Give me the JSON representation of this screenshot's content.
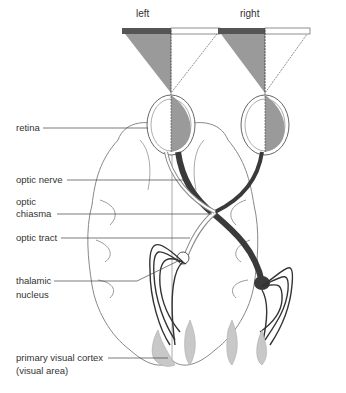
{
  "fields": {
    "left_label": "left",
    "right_label": "right"
  },
  "labels": {
    "retina": "retina",
    "optic_nerve": "optic nerve",
    "optic_chiasma_1": "optic",
    "optic_chiasma_2": "chiasma",
    "optic_tract": "optic tract",
    "thalamic_1": "thalamic",
    "thalamic_2": "nucleus",
    "cortex_1": "primary visual cortex",
    "cortex_2": "(visual area)"
  },
  "colors": {
    "dark_band": "#555555",
    "shade": "#9a9a9a",
    "pathway": "#3a3a3a",
    "cortex": "#c8c8c8",
    "outline": "#777777"
  }
}
